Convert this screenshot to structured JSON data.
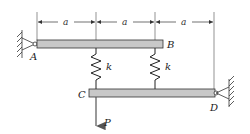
{
  "figure": {
    "dimensions": [
      {
        "label": "a"
      },
      {
        "label": "a"
      },
      {
        "label": "a"
      }
    ],
    "points": {
      "A": "A",
      "B": "B",
      "C": "C",
      "D": "D"
    },
    "springs": [
      {
        "label": "k"
      },
      {
        "label": "k"
      }
    ],
    "load": {
      "label": "P"
    },
    "colors": {
      "bar_fill": "#c8c8c8",
      "bar_stroke": "#333333",
      "line": "#444444"
    }
  }
}
